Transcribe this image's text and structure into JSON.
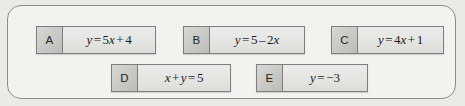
{
  "panel": {
    "name": "equation-option-bank",
    "border_color": "#8d8d8d",
    "background_color": "#f3f2ef",
    "page_background_color": "#eceae5"
  },
  "options": [
    {
      "letter": "A",
      "equation": "y = 5x + 4",
      "tokens": [
        {
          "t": "y",
          "italic": true
        },
        {
          "t": "=",
          "op": true
        },
        {
          "t": "5",
          "italic": false
        },
        {
          "t": "x",
          "italic": true
        },
        {
          "t": "+",
          "op": true
        },
        {
          "t": "4",
          "italic": false
        }
      ]
    },
    {
      "letter": "B",
      "equation": "y = 5 – 2x",
      "tokens": [
        {
          "t": "y",
          "italic": true
        },
        {
          "t": "=",
          "op": true
        },
        {
          "t": "5",
          "italic": false
        },
        {
          "t": "–",
          "op": true
        },
        {
          "t": "2",
          "italic": false
        },
        {
          "t": "x",
          "italic": true
        }
      ]
    },
    {
      "letter": "C",
      "equation": "y = 4x + 1",
      "tokens": [
        {
          "t": "y",
          "italic": true
        },
        {
          "t": "=",
          "op": true
        },
        {
          "t": "4",
          "italic": false
        },
        {
          "t": "x",
          "italic": true
        },
        {
          "t": "+",
          "op": true
        },
        {
          "t": "1",
          "italic": false
        }
      ]
    },
    {
      "letter": "D",
      "equation": "x + y = 5",
      "tokens": [
        {
          "t": "x",
          "italic": true
        },
        {
          "t": "+",
          "op": true
        },
        {
          "t": "y",
          "italic": true
        },
        {
          "t": "=",
          "op": true
        },
        {
          "t": "5",
          "italic": false
        }
      ]
    },
    {
      "letter": "E",
      "equation": "y = −3",
      "tokens": [
        {
          "t": "y",
          "italic": true
        },
        {
          "t": "=",
          "op": true
        },
        {
          "t": "−3",
          "italic": false
        }
      ]
    }
  ]
}
